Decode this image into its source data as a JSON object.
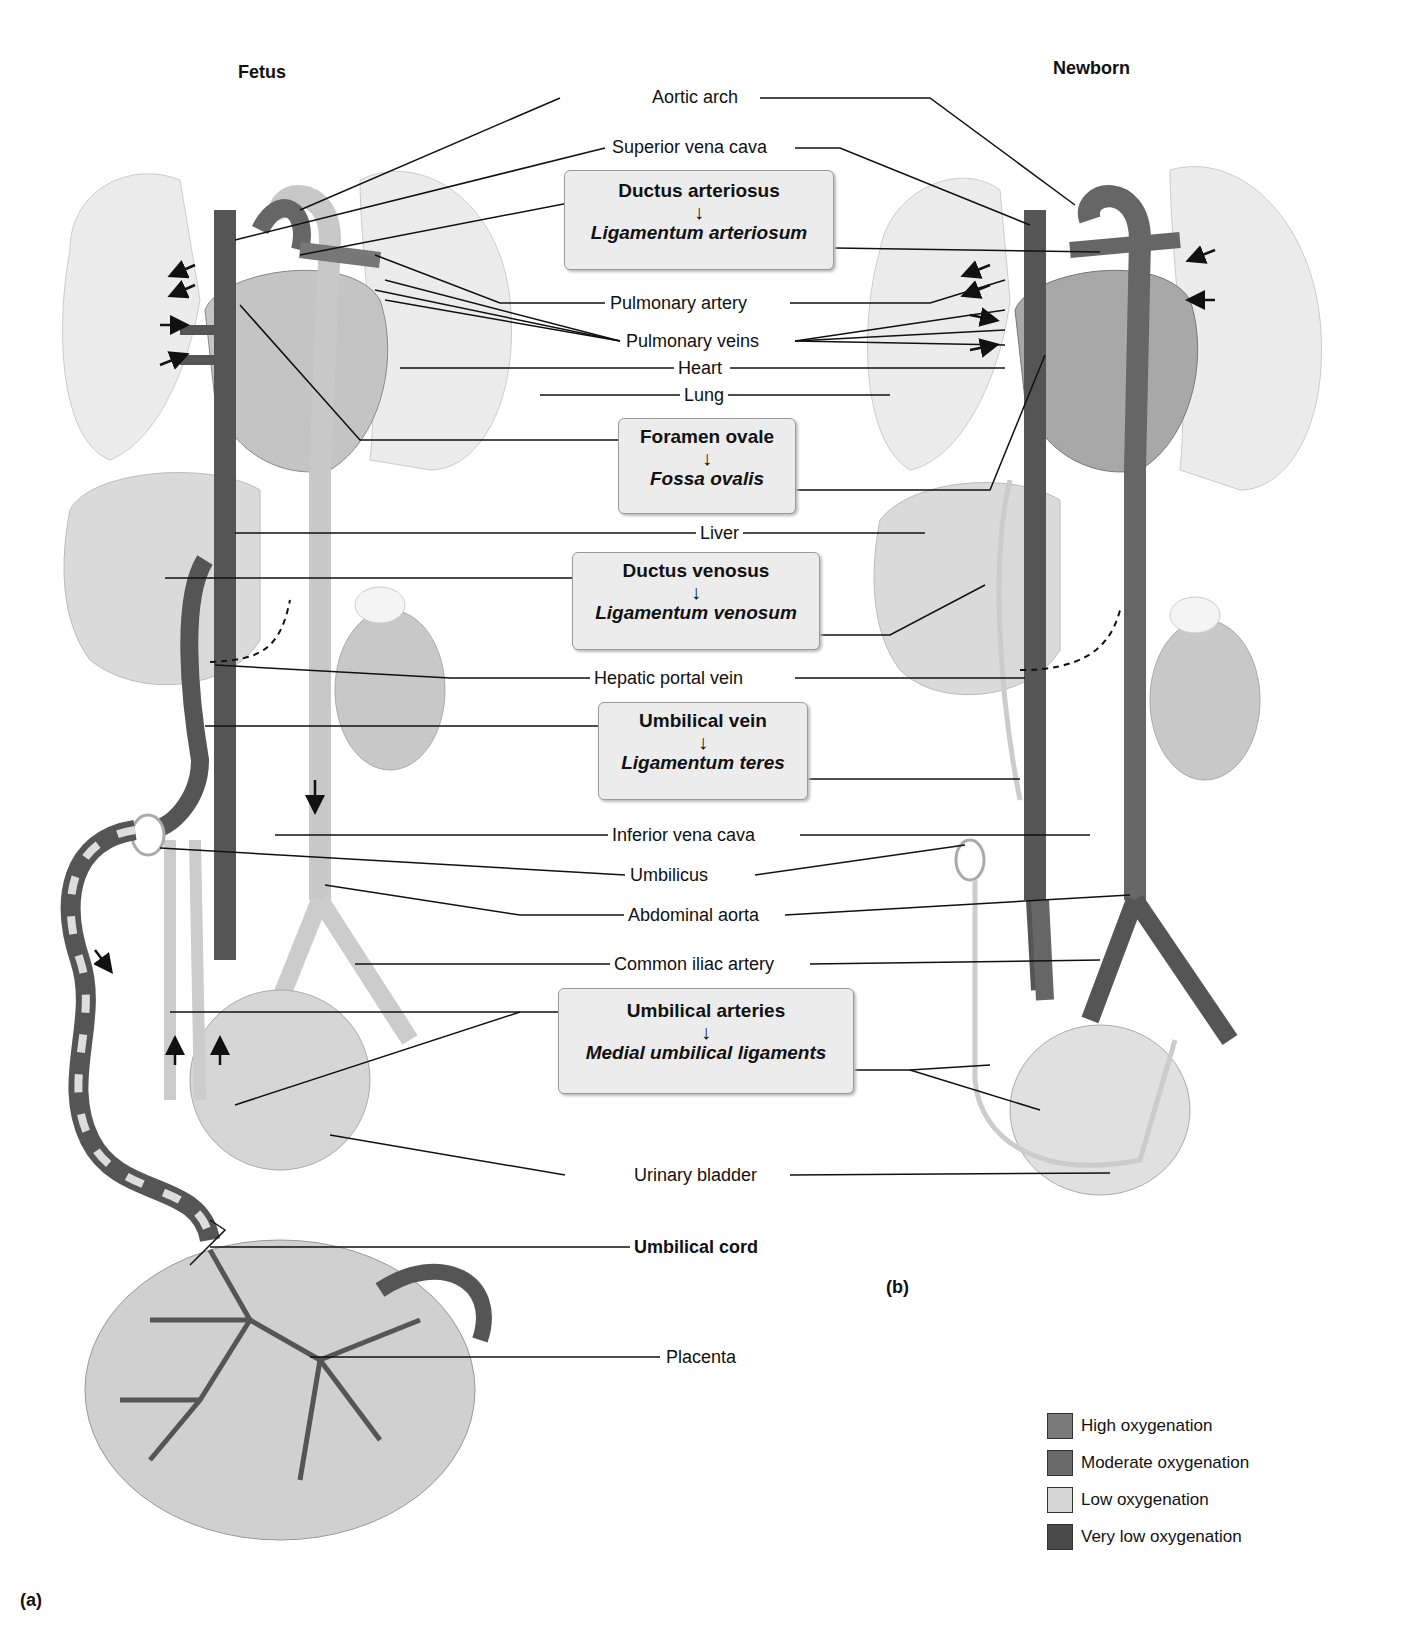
{
  "panels": {
    "a": {
      "title": "Fetus",
      "letter": "(a)"
    },
    "b": {
      "title": "Newborn",
      "letter": "(b)"
    }
  },
  "labels": {
    "aortic_arch": "Aortic arch",
    "superior_vena_cava": "Superior vena cava",
    "pulmonary_artery": "Pulmonary artery",
    "pulmonary_veins": "Pulmonary veins",
    "heart": "Heart",
    "lung": "Lung",
    "liver": "Liver",
    "hepatic_portal_vein": "Hepatic portal vein",
    "inferior_vena_cava": "Inferior vena cava",
    "umbilicus": "Umbilicus",
    "abdominal_aorta": "Abdominal aorta",
    "common_iliac_artery": "Common iliac artery",
    "urinary_bladder": "Urinary bladder",
    "umbilical_cord": "Umbilical cord",
    "placenta": "Placenta"
  },
  "transitions": [
    {
      "fetal": "Ductus arteriosus",
      "newborn": "Ligamentum arteriosum"
    },
    {
      "fetal": "Foramen ovale",
      "newborn": "Fossa ovalis"
    },
    {
      "fetal": "Ductus venosus",
      "newborn": "Ligamentum venosum"
    },
    {
      "fetal": "Umbilical vein",
      "newborn": "Ligamentum teres"
    },
    {
      "fetal": "Umbilical arteries",
      "newborn": "Medial umbilical ligaments"
    }
  ],
  "arrow_glyph": "↓",
  "legend": [
    {
      "label": "High oxygenation",
      "color": "#7a7a7a"
    },
    {
      "label": "Moderate oxygenation",
      "color": "#6a6a6a"
    },
    {
      "label": "Low oxygenation",
      "color": "#d4d4d4"
    },
    {
      "label": "Very low oxygenation",
      "color": "#4a4a4a"
    }
  ]
}
